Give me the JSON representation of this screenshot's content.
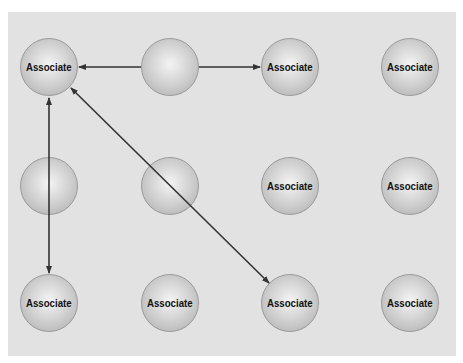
{
  "diagram": {
    "background": "#e2e2e2",
    "node_label": "Associate",
    "nodes": [
      {
        "id": "n00",
        "row": 0,
        "col": 0,
        "label": "Associate",
        "cx": 49,
        "cy": 67
      },
      {
        "id": "n01",
        "row": 0,
        "col": 1,
        "label": "",
        "cx": 170,
        "cy": 67
      },
      {
        "id": "n02",
        "row": 0,
        "col": 2,
        "label": "Associate",
        "cx": 290,
        "cy": 67
      },
      {
        "id": "n03",
        "row": 0,
        "col": 3,
        "label": "Associate",
        "cx": 410,
        "cy": 67
      },
      {
        "id": "n10",
        "row": 1,
        "col": 0,
        "label": "",
        "cx": 49,
        "cy": 186
      },
      {
        "id": "n11",
        "row": 1,
        "col": 1,
        "label": "",
        "cx": 170,
        "cy": 186
      },
      {
        "id": "n12",
        "row": 1,
        "col": 2,
        "label": "Associate",
        "cx": 290,
        "cy": 186
      },
      {
        "id": "n13",
        "row": 1,
        "col": 3,
        "label": "Associate",
        "cx": 410,
        "cy": 186
      },
      {
        "id": "n20",
        "row": 2,
        "col": 0,
        "label": "Associate",
        "cx": 49,
        "cy": 303
      },
      {
        "id": "n21",
        "row": 2,
        "col": 1,
        "label": "Associate",
        "cx": 170,
        "cy": 303
      },
      {
        "id": "n22",
        "row": 2,
        "col": 2,
        "label": "Associate",
        "cx": 290,
        "cy": 303
      },
      {
        "id": "n23",
        "row": 2,
        "col": 3,
        "label": "Associate",
        "cx": 410,
        "cy": 303
      }
    ],
    "edges": [
      {
        "from": "n01",
        "to": "n00",
        "type": "arrow"
      },
      {
        "from": "n01",
        "to": "n02",
        "type": "arrow"
      },
      {
        "from": "n00",
        "to": "n20",
        "type": "bidirectional"
      },
      {
        "from": "n00",
        "to": "n22",
        "type": "bidirectional"
      }
    ]
  }
}
